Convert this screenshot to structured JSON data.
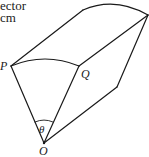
{
  "caption": {
    "line1": "ector",
    "line2": "cm"
  },
  "labels": {
    "P": "P",
    "Q": "Q",
    "O": "O",
    "theta": "θ"
  },
  "figure": {
    "vertices": {
      "P": [
        11,
        66
      ],
      "Q": [
        79,
        66
      ],
      "O": [
        44,
        143
      ],
      "P_back": [
        83,
        10
      ],
      "Q_back": [
        148,
        15
      ],
      "O_back": [
        117,
        87
      ]
    },
    "stroke_color": "#1a1a1a"
  }
}
